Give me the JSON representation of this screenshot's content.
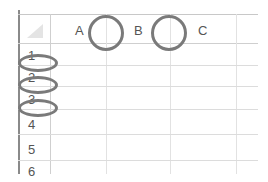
{
  "spreadsheet": {
    "column_headers": [
      "A",
      "B",
      "C"
    ],
    "row_headers": [
      "1",
      "2",
      "3",
      "4",
      "5",
      "6"
    ],
    "select_all_corner": "select-all-triangle"
  },
  "annotations": {
    "circles": [
      {
        "target": "column-boundary-A-B"
      },
      {
        "target": "column-boundary-B-C"
      }
    ],
    "ellipses": [
      {
        "target": "row-boundary-1-2"
      },
      {
        "target": "row-boundary-2-3"
      },
      {
        "target": "row-boundary-3-4"
      }
    ],
    "color": "#7a7a7a"
  },
  "colors": {
    "gridline": "#dcdcdc",
    "header_text": "#555555",
    "frame": "#8a8a8a"
  }
}
